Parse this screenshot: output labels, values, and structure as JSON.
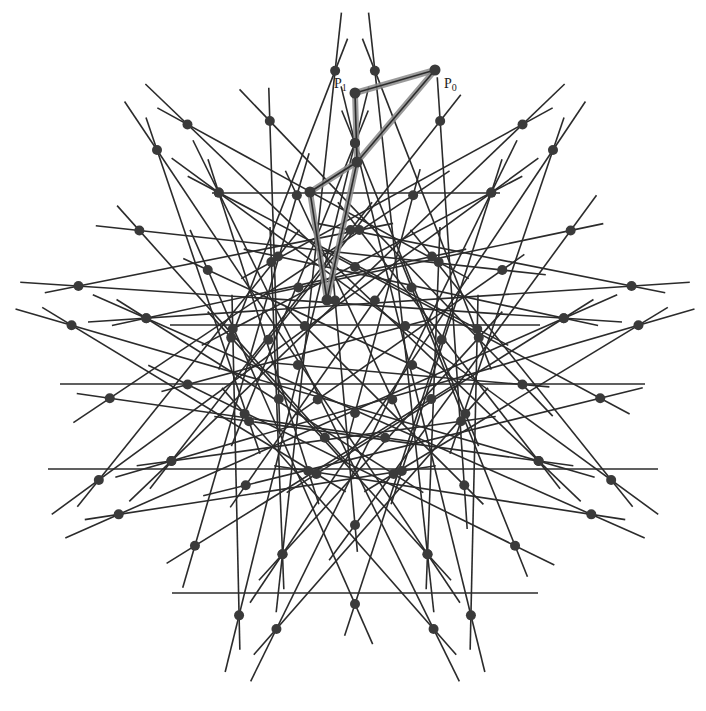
{
  "figure": {
    "labels": [
      {
        "id": "P1",
        "base": "P",
        "sub": "1"
      },
      {
        "id": "P0",
        "base": "P",
        "sub": "0"
      }
    ],
    "symmetry_order": 9,
    "highlighted_path": [
      "P0",
      "P1",
      "interior vertex",
      "interior vertex",
      "interior vertex"
    ],
    "colors": {
      "line": "#2b2b2b",
      "node": "#3a3a3a",
      "highlight": "#8a8a8a",
      "background": "#ffffff"
    }
  }
}
